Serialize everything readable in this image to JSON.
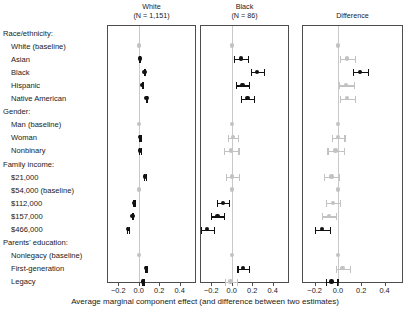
{
  "chart_data": {
    "type": "scatter",
    "title": "",
    "xlabel": "Average marginal component effect (and difference between two estimates)",
    "ylabel": "",
    "xlim": [
      -0.3,
      0.55
    ],
    "xticks": [
      -0.2,
      0.0,
      0.2,
      0.4
    ],
    "xticklabels": [
      "−0.2",
      "0.0",
      "0.2",
      "0.4"
    ],
    "grid": false,
    "legend": "none",
    "zero_reference_line": 0.0,
    "categories": [
      {
        "label": "Race/ethnicity:",
        "type": "header"
      },
      {
        "label": "White (baseline)",
        "type": "item"
      },
      {
        "label": "Asian",
        "type": "item"
      },
      {
        "label": "Black",
        "type": "item"
      },
      {
        "label": "Hispanic",
        "type": "item"
      },
      {
        "label": "Native American",
        "type": "item"
      },
      {
        "label": "Gender:",
        "type": "header"
      },
      {
        "label": "Man (baseline)",
        "type": "item"
      },
      {
        "label": "Woman",
        "type": "item"
      },
      {
        "label": "Nonbinary",
        "type": "item"
      },
      {
        "label": "Family income:",
        "type": "header"
      },
      {
        "label": "$21,000",
        "type": "item"
      },
      {
        "label": "$54,000 (baseline)",
        "type": "item"
      },
      {
        "label": "$112,000",
        "type": "item"
      },
      {
        "label": "$157,000",
        "type": "item"
      },
      {
        "label": "$466,000",
        "type": "item"
      },
      {
        "label": "Parents' education:",
        "type": "header"
      },
      {
        "label": "Nonlegacy (baseline)",
        "type": "item"
      },
      {
        "label": "First-generation",
        "type": "item"
      },
      {
        "label": "Legacy",
        "type": "item"
      }
    ],
    "panels": [
      {
        "name": "white",
        "title_line1": "White",
        "title_line2": "(N = 1,151)",
        "n": 1151,
        "points": [
          {
            "category": "Race/ethnicity:",
            "estimate": null,
            "lo": null,
            "hi": null,
            "style": "none"
          },
          {
            "category": "White (baseline)",
            "estimate": 0.0,
            "lo": 0.0,
            "hi": 0.0,
            "style": "light"
          },
          {
            "category": "Asian",
            "estimate": 0.01,
            "lo": 0.005,
            "hi": 0.015,
            "style": "dark"
          },
          {
            "category": "Black",
            "estimate": 0.055,
            "lo": 0.05,
            "hi": 0.06,
            "style": "dark"
          },
          {
            "category": "Hispanic",
            "estimate": 0.035,
            "lo": 0.03,
            "hi": 0.04,
            "style": "dark"
          },
          {
            "category": "Native American",
            "estimate": 0.075,
            "lo": 0.07,
            "hi": 0.08,
            "style": "dark"
          },
          {
            "category": "Gender:",
            "estimate": null,
            "lo": null,
            "hi": null,
            "style": "none"
          },
          {
            "category": "Man (baseline)",
            "estimate": 0.0,
            "lo": 0.0,
            "hi": 0.0,
            "style": "light"
          },
          {
            "category": "Woman",
            "estimate": 0.012,
            "lo": 0.006,
            "hi": 0.018,
            "style": "dark"
          },
          {
            "category": "Nonbinary",
            "estimate": 0.012,
            "lo": 0.004,
            "hi": 0.02,
            "style": "dark"
          },
          {
            "category": "Family income:",
            "estimate": null,
            "lo": null,
            "hi": null,
            "style": "none"
          },
          {
            "category": "$21,000",
            "estimate": 0.06,
            "lo": 0.053,
            "hi": 0.067,
            "style": "dark"
          },
          {
            "category": "$54,000 (baseline)",
            "estimate": 0.0,
            "lo": 0.0,
            "hi": 0.0,
            "style": "light"
          },
          {
            "category": "$112,000",
            "estimate": -0.045,
            "lo": -0.052,
            "hi": -0.038,
            "style": "dark"
          },
          {
            "category": "$157,000",
            "estimate": -0.062,
            "lo": -0.069,
            "hi": -0.055,
            "style": "dark"
          },
          {
            "category": "$466,000",
            "estimate": -0.105,
            "lo": -0.113,
            "hi": -0.097,
            "style": "dark"
          },
          {
            "category": "Parents' education:",
            "estimate": null,
            "lo": null,
            "hi": null,
            "style": "none"
          },
          {
            "category": "Nonlegacy (baseline)",
            "estimate": 0.0,
            "lo": 0.0,
            "hi": 0.0,
            "style": "light"
          },
          {
            "category": "First-generation",
            "estimate": 0.07,
            "lo": 0.064,
            "hi": 0.076,
            "style": "dark"
          },
          {
            "category": "Legacy",
            "estimate": 0.04,
            "lo": 0.034,
            "hi": 0.046,
            "style": "dark"
          }
        ]
      },
      {
        "name": "black",
        "title_line1": "Black",
        "title_line2": "(N = 86)",
        "n": 86,
        "points": [
          {
            "category": "Race/ethnicity:",
            "estimate": null,
            "lo": null,
            "hi": null,
            "style": "none"
          },
          {
            "category": "White (baseline)",
            "estimate": 0.0,
            "lo": 0.0,
            "hi": 0.0,
            "style": "light"
          },
          {
            "category": "Asian",
            "estimate": 0.09,
            "lo": 0.025,
            "hi": 0.155,
            "style": "dark"
          },
          {
            "category": "Black",
            "estimate": 0.25,
            "lo": 0.185,
            "hi": 0.315,
            "style": "dark"
          },
          {
            "category": "Hispanic",
            "estimate": 0.105,
            "lo": 0.04,
            "hi": 0.17,
            "style": "dark"
          },
          {
            "category": "Native American",
            "estimate": 0.155,
            "lo": 0.09,
            "hi": 0.22,
            "style": "dark"
          },
          {
            "category": "Gender:",
            "estimate": null,
            "lo": null,
            "hi": null,
            "style": "none"
          },
          {
            "category": "Man (baseline)",
            "estimate": 0.0,
            "lo": 0.0,
            "hi": 0.0,
            "style": "light"
          },
          {
            "category": "Woman",
            "estimate": 0.01,
            "lo": -0.04,
            "hi": 0.06,
            "style": "light"
          },
          {
            "category": "Nonbinary",
            "estimate": -0.005,
            "lo": -0.075,
            "hi": 0.065,
            "style": "light"
          },
          {
            "category": "Family income:",
            "estimate": null,
            "lo": null,
            "hi": null,
            "style": "none"
          },
          {
            "category": "$21,000",
            "estimate": 0.005,
            "lo": -0.06,
            "hi": 0.07,
            "style": "light"
          },
          {
            "category": "$54,000 (baseline)",
            "estimate": 0.0,
            "lo": 0.0,
            "hi": 0.0,
            "style": "light"
          },
          {
            "category": "$112,000",
            "estimate": -0.085,
            "lo": -0.145,
            "hi": -0.025,
            "style": "dark"
          },
          {
            "category": "$157,000",
            "estimate": -0.14,
            "lo": -0.2,
            "hi": -0.08,
            "style": "dark"
          },
          {
            "category": "$466,000",
            "estimate": -0.24,
            "lo": -0.305,
            "hi": -0.175,
            "style": "dark"
          },
          {
            "category": "Parents' education:",
            "estimate": null,
            "lo": null,
            "hi": null,
            "style": "none"
          },
          {
            "category": "Nonlegacy (baseline)",
            "estimate": 0.0,
            "lo": 0.0,
            "hi": 0.0,
            "style": "light"
          },
          {
            "category": "First-generation",
            "estimate": 0.11,
            "lo": 0.055,
            "hi": 0.165,
            "style": "dark"
          },
          {
            "category": "Legacy",
            "estimate": -0.01,
            "lo": -0.07,
            "hi": 0.05,
            "style": "light"
          }
        ]
      },
      {
        "name": "difference",
        "title_line1": "Difference",
        "title_line2": "",
        "n": null,
        "points": [
          {
            "category": "Race/ethnicity:",
            "estimate": null,
            "lo": null,
            "hi": null,
            "style": "none"
          },
          {
            "category": "White (baseline)",
            "estimate": 0.0,
            "lo": 0.0,
            "hi": 0.0,
            "style": "light"
          },
          {
            "category": "Asian",
            "estimate": 0.08,
            "lo": 0.015,
            "hi": 0.145,
            "style": "light"
          },
          {
            "category": "Black",
            "estimate": 0.19,
            "lo": 0.13,
            "hi": 0.255,
            "style": "dark"
          },
          {
            "category": "Hispanic",
            "estimate": 0.07,
            "lo": 0.005,
            "hi": 0.135,
            "style": "light"
          },
          {
            "category": "Native American",
            "estimate": 0.08,
            "lo": 0.015,
            "hi": 0.145,
            "style": "light"
          },
          {
            "category": "Gender:",
            "estimate": null,
            "lo": null,
            "hi": null,
            "style": "none"
          },
          {
            "category": "Man (baseline)",
            "estimate": 0.0,
            "lo": 0.0,
            "hi": 0.0,
            "style": "light"
          },
          {
            "category": "Woman",
            "estimate": 0.0,
            "lo": -0.055,
            "hi": 0.055,
            "style": "light"
          },
          {
            "category": "Nonbinary",
            "estimate": -0.02,
            "lo": -0.09,
            "hi": 0.05,
            "style": "light"
          },
          {
            "category": "Family income:",
            "estimate": null,
            "lo": null,
            "hi": null,
            "style": "none"
          },
          {
            "category": "$21,000",
            "estimate": -0.055,
            "lo": -0.12,
            "hi": 0.01,
            "style": "light"
          },
          {
            "category": "$54,000 (baseline)",
            "estimate": 0.0,
            "lo": 0.0,
            "hi": 0.0,
            "style": "light"
          },
          {
            "category": "$112,000",
            "estimate": -0.04,
            "lo": -0.1,
            "hi": 0.02,
            "style": "light"
          },
          {
            "category": "$157,000",
            "estimate": -0.075,
            "lo": -0.14,
            "hi": -0.015,
            "style": "light"
          },
          {
            "category": "$466,000",
            "estimate": -0.135,
            "lo": -0.2,
            "hi": -0.07,
            "style": "dark"
          },
          {
            "category": "Parents' education:",
            "estimate": null,
            "lo": null,
            "hi": null,
            "style": "none"
          },
          {
            "category": "Nonlegacy (baseline)",
            "estimate": 0.0,
            "lo": 0.0,
            "hi": 0.0,
            "style": "light"
          },
          {
            "category": "First-generation",
            "estimate": 0.04,
            "lo": -0.02,
            "hi": 0.1,
            "style": "light"
          },
          {
            "category": "Legacy",
            "estimate": -0.055,
            "lo": -0.105,
            "hi": -0.005,
            "style": "dark"
          }
        ]
      }
    ]
  }
}
